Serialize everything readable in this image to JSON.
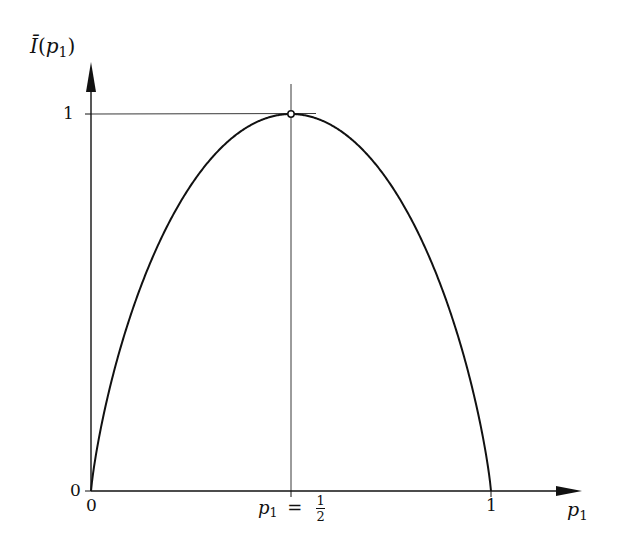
{
  "chart_data": {
    "type": "line",
    "title": "",
    "xlabel": "p1",
    "ylabel": "Ī(p1)",
    "xlim": [
      0,
      1.2
    ],
    "ylim": [
      0,
      1.1
    ],
    "grid": false,
    "legend": null,
    "x_ticks": [
      {
        "value": 0,
        "label": "0"
      },
      {
        "value": 0.5,
        "label": "p1 = 1/2"
      },
      {
        "value": 1,
        "label": "1"
      }
    ],
    "y_ticks": [
      {
        "value": 0,
        "label": "0"
      },
      {
        "value": 1,
        "label": "1"
      }
    ],
    "series": [
      {
        "name": "Ī(p1) = -p1 log2 p1 - (1-p1) log2 (1-p1)",
        "x": [
          0,
          0.05,
          0.1,
          0.15,
          0.2,
          0.25,
          0.3,
          0.35,
          0.4,
          0.45,
          0.5,
          0.55,
          0.6,
          0.65,
          0.7,
          0.75,
          0.8,
          0.85,
          0.9,
          0.95,
          1
        ],
        "values": [
          0,
          0.286,
          0.469,
          0.61,
          0.722,
          0.811,
          0.881,
          0.934,
          0.971,
          0.993,
          1,
          0.993,
          0.971,
          0.934,
          0.881,
          0.811,
          0.722,
          0.61,
          0.469,
          0.286,
          0
        ]
      }
    ],
    "annotations": [
      {
        "type": "marker",
        "shape": "open-circle",
        "x": 0.5,
        "y": 1
      },
      {
        "type": "guide-line",
        "orientation": "horizontal",
        "y": 1
      },
      {
        "type": "guide-line",
        "orientation": "vertical",
        "x": 0.5
      }
    ]
  },
  "labels": {
    "y_axis_name": "Ī",
    "y_axis_arg_open": "(",
    "y_axis_arg_var": "p",
    "y_axis_arg_sub": "1",
    "y_axis_arg_close": ")",
    "x_axis_var": "p",
    "x_axis_sub": "1",
    "y_tick_1": "1",
    "y_tick_0": "0",
    "x_tick_0": "0",
    "x_tick_1": "1",
    "x_tick_half_var": "p",
    "x_tick_half_sub": "1",
    "x_tick_half_eq": "=",
    "x_tick_half_num": "1",
    "x_tick_half_den": "2"
  }
}
